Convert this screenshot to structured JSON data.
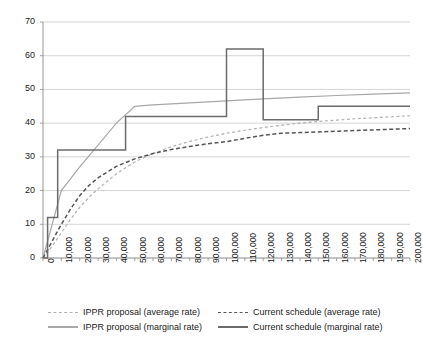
{
  "chart_data": {
    "type": "line",
    "title": "",
    "xlabel": "",
    "ylabel": "",
    "xlim": [
      0,
      200000
    ],
    "ylim": [
      0,
      70
    ],
    "grid": true,
    "legend_position": "bottom",
    "y_ticks": [
      0,
      10,
      20,
      30,
      40,
      50,
      60,
      70
    ],
    "y_tick_labels": [
      "0",
      "10",
      "20",
      "30",
      "40",
      "50",
      "60",
      "70"
    ],
    "x_ticks": [
      0,
      10000,
      20000,
      30000,
      40000,
      50000,
      60000,
      70000,
      80000,
      90000,
      100000,
      110000,
      120000,
      130000,
      140000,
      150000,
      160000,
      170000,
      180000,
      190000,
      200000
    ],
    "x_tick_labels": [
      "0",
      "10,000",
      "20,000",
      "30,000",
      "40,000",
      "50,000",
      "60,000",
      "70,000",
      "80,000",
      "90,000",
      "100,000",
      "110,000",
      "120,000",
      "130,000",
      "140,000",
      "150,000",
      "160,000",
      "170,000",
      "180,000",
      "190,000",
      "200,000"
    ],
    "series": [
      {
        "name": "IPPR proposal (average rate)",
        "style": "dashed",
        "color": "#b0b0b0",
        "x": [
          0,
          5000,
          10000,
          15000,
          20000,
          25000,
          30000,
          40000,
          50000,
          60000,
          70000,
          80000,
          90000,
          100000,
          110000,
          120000,
          130000,
          140000,
          150000,
          160000,
          170000,
          180000,
          190000,
          200000
        ],
        "values": [
          0,
          3.5,
          7.5,
          11.5,
          15.0,
          18.0,
          20.5,
          25.0,
          28.5,
          31.0,
          33.0,
          34.6,
          35.9,
          37.0,
          37.9,
          38.7,
          39.4,
          40.0,
          40.5,
          40.9,
          41.3,
          41.6,
          41.9,
          42.2
        ]
      },
      {
        "name": "IPPR proposal (marginal rate)",
        "style": "solid",
        "color": "#a8a8a8",
        "x": [
          0,
          10000,
          20000,
          30000,
          40000,
          45000,
          50000,
          60000,
          80000,
          100000,
          120000,
          140000,
          160000,
          180000,
          200000
        ],
        "values": [
          0,
          20.0,
          27.0,
          33.5,
          40.0,
          42.5,
          45.0,
          45.4,
          46.0,
          46.6,
          47.2,
          47.7,
          48.2,
          48.6,
          49.0
        ]
      },
      {
        "name": "Current schedule (average rate)",
        "style": "dashed",
        "color": "#555555",
        "x": [
          0,
          5000,
          10000,
          15000,
          20000,
          25000,
          30000,
          40000,
          50000,
          60000,
          70000,
          80000,
          90000,
          100000,
          110000,
          120000,
          130000,
          140000,
          150000,
          160000,
          170000,
          180000,
          190000,
          200000
        ],
        "values": [
          0,
          5.0,
          10.0,
          14.5,
          18.5,
          21.5,
          23.8,
          27.2,
          29.4,
          31.0,
          32.2,
          33.1,
          33.9,
          34.5,
          35.5,
          36.4,
          37.0,
          37.2,
          37.4,
          37.6,
          37.8,
          38.0,
          38.2,
          38.4
        ]
      },
      {
        "name": "Current schedule (marginal rate)",
        "style": "solid-step",
        "color": "#6b6b6b",
        "x": [
          0,
          2500,
          2500,
          8000,
          8000,
          45000,
          45000,
          100000,
          100000,
          120000,
          120000,
          150000,
          150000,
          200000
        ],
        "values": [
          0,
          0,
          12.0,
          12.0,
          32.0,
          32.0,
          42.0,
          42.0,
          62.0,
          62.0,
          41.0,
          41.0,
          45.0,
          45.0
        ]
      }
    ],
    "legend": [
      {
        "label": "IPPR proposal (average rate)",
        "swatch": "dash-light"
      },
      {
        "label": "Current schedule (average rate)",
        "swatch": "dash-dark"
      },
      {
        "label": "IPPR proposal (marginal rate)",
        "swatch": "solid-light"
      },
      {
        "label": "Current schedule (marginal rate)",
        "swatch": "solid-dark"
      }
    ],
    "colors": {
      "grid": "#c9c9c9",
      "axis": "#8a8a8a",
      "ippr_average": "#b0b0b0",
      "ippr_marginal": "#a8a8a8",
      "current_average": "#555555",
      "current_marginal": "#6b6b6b"
    }
  }
}
